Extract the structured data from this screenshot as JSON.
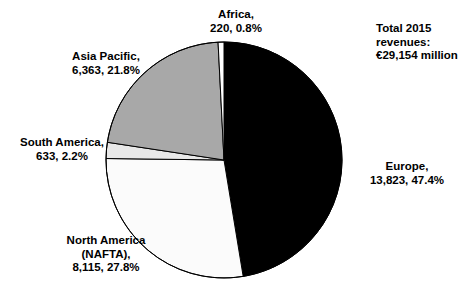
{
  "chart_data": {
    "type": "pie",
    "title": "",
    "total_label": [
      "Total 2015",
      "revenues:",
      "€29,154 million"
    ],
    "total_value": 29154,
    "currency": "€",
    "units": "million",
    "legend_position": "outside-labels",
    "start_angle_deg": 0,
    "direction": "clockwise",
    "categories": [
      "Europe",
      "North America (NAFTA)",
      "South America",
      "Asia Pacific",
      "Africa"
    ],
    "values": [
      13823,
      8115,
      633,
      6363,
      220
    ],
    "percents": [
      47.4,
      27.8,
      2.2,
      21.8,
      0.8
    ],
    "colors": [
      "#000000",
      "#fbfbfb",
      "#e8e8e8",
      "#a8a8a8",
      "#ffffff"
    ],
    "slices": [
      {
        "name": "Europe",
        "value": 13823,
        "value_text": "13,823",
        "percent": 47.4,
        "percent_text": "47.4%",
        "color": "#000000",
        "label_lines": [
          "Europe,",
          "13,823, 47.4%"
        ]
      },
      {
        "name": "North America (NAFTA)",
        "value": 8115,
        "value_text": "8,115",
        "percent": 27.8,
        "percent_text": "27.8%",
        "color": "#fbfbfb",
        "label_lines": [
          "North America",
          "(NAFTA),",
          "8,115, 27.8%"
        ]
      },
      {
        "name": "South America",
        "value": 633,
        "value_text": "633",
        "percent": 2.2,
        "percent_text": "2.2%",
        "color": "#e8e8e8",
        "label_lines": [
          "South America,",
          "633, 2.2%"
        ]
      },
      {
        "name": "Asia Pacific",
        "value": 6363,
        "value_text": "6,363",
        "percent": 21.8,
        "percent_text": "21.8%",
        "color": "#a8a8a8",
        "label_lines": [
          "Asia Pacific,",
          "6,363, 21.8%"
        ]
      },
      {
        "name": "Africa",
        "value": 220,
        "value_text": "220",
        "percent": 0.8,
        "percent_text": "0.8%",
        "color": "#ffffff",
        "label_lines": [
          "Africa,",
          "220, 0.8%"
        ]
      }
    ]
  },
  "labels": {
    "africa": {
      "l1": "Africa,",
      "l2": "220, 0.8%"
    },
    "asia": {
      "l1": "Asia Pacific,",
      "l2": "6,363, 21.8%"
    },
    "south": {
      "l1": "South America,",
      "l2": "633, 2.2%"
    },
    "north": {
      "l1": "North America",
      "l2": "(NAFTA),",
      "l3": "8,115, 27.8%"
    },
    "europe": {
      "l1": "Europe,",
      "l2": "13,823, 47.4%"
    },
    "total": {
      "l1": "Total 2015",
      "l2": "revenues:",
      "l3": "€29,154 million"
    }
  }
}
